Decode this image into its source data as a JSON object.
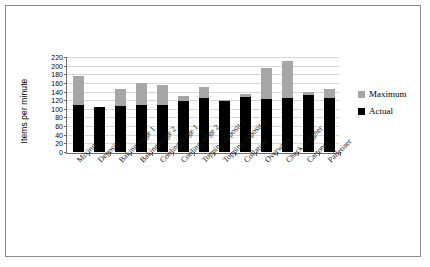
{
  "chart_data": {
    "type": "bar",
    "title": "",
    "xlabel": "",
    "ylabel": "Items per minute",
    "ylim": [
      0,
      220
    ],
    "ytick_step": 20,
    "yticks": [
      0,
      20,
      40,
      60,
      80,
      100,
      120,
      140,
      160,
      180,
      200,
      220
    ],
    "grid": true,
    "legend_position": "right",
    "bar_style": "overlaid",
    "categories": [
      "Mixing",
      "Deposit",
      "Baking stage 1",
      "Baking stage 2",
      "Cooling stage 1",
      "Cooling stage 2",
      "Topping deposit 1",
      "Topping deposit 2",
      "Collation",
      "Overwrap",
      "Check weigher",
      "Cartoner",
      "Palletiser"
    ],
    "series": [
      {
        "name": "Maximum",
        "color": "#a6a6a6",
        "values": [
          175,
          105,
          145,
          160,
          155,
          130,
          150,
          120,
          135,
          195,
          210,
          140,
          145
        ]
      },
      {
        "name": "Actual",
        "color": "#000000",
        "values": [
          110,
          105,
          107,
          108,
          110,
          118,
          125,
          118,
          128,
          122,
          125,
          132,
          125
        ]
      }
    ]
  },
  "legend": {
    "items": [
      {
        "label": "Maximum",
        "color": "#a6a6a6"
      },
      {
        "label": "Actual",
        "color": "#000000"
      }
    ]
  },
  "axis": {
    "y_title": "Items per minute"
  }
}
